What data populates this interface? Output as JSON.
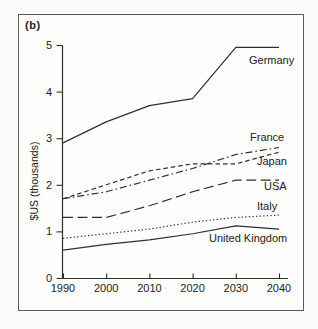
{
  "figure_label": "(b)",
  "chart_data": {
    "type": "line",
    "title": "",
    "xlabel": "",
    "ylabel": "$US (thousands)",
    "x": [
      1990,
      2000,
      2010,
      2020,
      2030,
      2040
    ],
    "xlim": [
      1990,
      2040
    ],
    "ylim": [
      0,
      5
    ],
    "yticks": [
      0,
      1,
      2,
      3,
      4,
      5
    ],
    "grid": false,
    "legend_position": "inline-labels-right-of-lines",
    "series": [
      {
        "name": "Germany",
        "style": "solid",
        "values": [
          2.9,
          3.35,
          3.7,
          3.85,
          4.95,
          4.95
        ],
        "label_pos": [
          249,
          64
        ]
      },
      {
        "name": "France",
        "style": "dashdot",
        "values": [
          1.7,
          1.85,
          2.1,
          2.35,
          2.65,
          2.8
        ],
        "label_pos": [
          250,
          141
        ]
      },
      {
        "name": "Japan",
        "style": "shortdash",
        "values": [
          1.7,
          2.0,
          2.3,
          2.45,
          2.45,
          2.7
        ],
        "label_pos": [
          257,
          165
        ]
      },
      {
        "name": "USA",
        "style": "longdash",
        "values": [
          1.3,
          1.3,
          1.55,
          1.85,
          2.1,
          2.1
        ],
        "label_pos": [
          264,
          190
        ]
      },
      {
        "name": "Italy",
        "style": "dotted",
        "values": [
          0.85,
          0.95,
          1.05,
          1.2,
          1.3,
          1.35
        ],
        "label_pos": [
          257,
          210
        ]
      },
      {
        "name": "United Kingdom",
        "style": "solid",
        "values": [
          0.6,
          0.72,
          0.82,
          0.95,
          1.12,
          1.05
        ],
        "label_pos": [
          209,
          242
        ]
      }
    ]
  },
  "colors": {
    "line": "#2f2f2f",
    "text": "#222222",
    "frame": "#5a5a5a",
    "background": "#fdfdfc"
  }
}
